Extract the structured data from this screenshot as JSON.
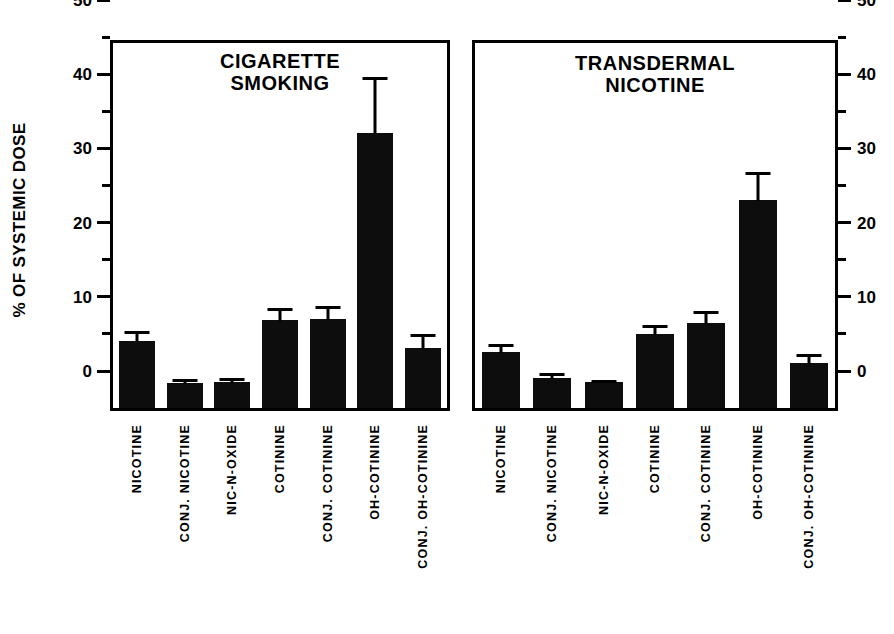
{
  "chart_data": {
    "type": "bar",
    "title": "",
    "xlabel": "",
    "ylabel": "% OF SYSTEMIC DOSE",
    "ylim": [
      0,
      50
    ],
    "ytick_major": [
      0,
      10,
      20,
      30,
      40,
      50
    ],
    "ytick_minor": [
      5,
      15,
      25,
      35,
      45
    ],
    "grid": false,
    "legend": "none",
    "error_bars": "upper only (SEM)",
    "categories": [
      "NICOTINE",
      "CONJ. NICOTINE",
      "NIC-N-OXIDE",
      "COTININE",
      "CONJ. COTININE",
      "OH-COTININE",
      "CONJ. OH-COTININE"
    ],
    "panels": [
      {
        "title_lines": [
          "CIGARETTE",
          "SMOKING"
        ],
        "axis_side": "left",
        "values": [
          9.0,
          3.4,
          3.5,
          11.8,
          12.0,
          37.0,
          8.1
        ],
        "errors": [
          1.2,
          0.4,
          0.4,
          1.6,
          1.6,
          7.5,
          1.7
        ]
      },
      {
        "title_lines": [
          "TRANSDERMAL",
          "NICOTINE"
        ],
        "axis_side": "right",
        "values": [
          7.5,
          4.0,
          3.5,
          10.0,
          11.5,
          28.0,
          6.0
        ],
        "errors": [
          1.0,
          0.6,
          0.2,
          1.1,
          1.5,
          3.7,
          1.1
        ]
      }
    ]
  },
  "axis": {
    "labels": [
      "0",
      "10",
      "20",
      "30",
      "40",
      "50"
    ]
  },
  "colors": {
    "bar": "#0d0d0d",
    "axis": "#000000",
    "background": "#ffffff"
  }
}
